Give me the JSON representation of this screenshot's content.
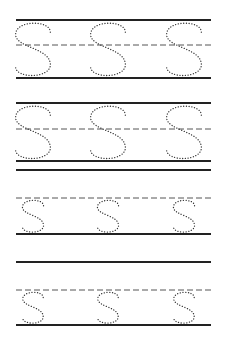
{
  "worksheet": {
    "letter": "S",
    "letters_per_row": 3,
    "colors": {
      "line": "#222222",
      "guide": "#555555",
      "dots": "#333333"
    },
    "rows": [
      {
        "size": "large",
        "top": 20,
        "mid": 45,
        "base": 78
      },
      {
        "size": "large",
        "top": 103,
        "mid": 129,
        "base": 161,
        "extra_line": 170
      },
      {
        "size": "small",
        "mid": 198,
        "base": 234,
        "extra_line": 262
      },
      {
        "size": "small",
        "mid": 290,
        "base": 325
      }
    ],
    "letter_x": [
      33,
      108,
      184
    ]
  }
}
